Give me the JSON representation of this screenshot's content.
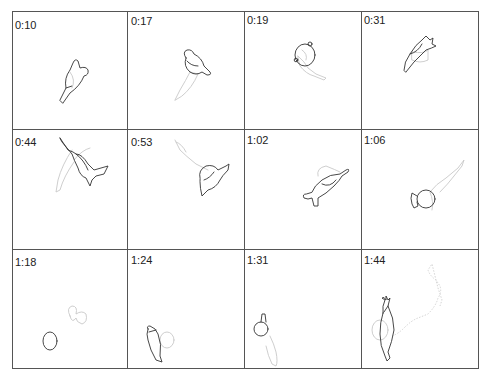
{
  "figure": {
    "grid": {
      "columns": 4,
      "rows": 3
    },
    "colors": {
      "grid_line": "#555555",
      "outline": "#333333",
      "ghost_outline": "#c8c8c8",
      "label": "#222222"
    },
    "panels": [
      {
        "label": "0:10"
      },
      {
        "label": "0:17"
      },
      {
        "label": "0:19"
      },
      {
        "label": "0:31"
      },
      {
        "label": "0:44"
      },
      {
        "label": "0:53"
      },
      {
        "label": "1:02"
      },
      {
        "label": "1:06"
      },
      {
        "label": "1:18"
      },
      {
        "label": "1:24"
      },
      {
        "label": "1:31"
      },
      {
        "label": "1:44"
      }
    ]
  }
}
